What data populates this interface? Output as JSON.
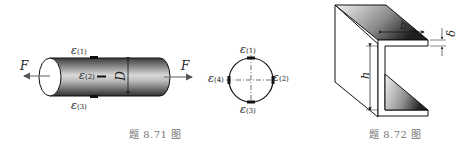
{
  "figure_871": {
    "caption": "题 8.71 图",
    "force_left": "F",
    "force_right": "F",
    "diameter_label": "D",
    "gauges_side_view": [
      {
        "symbol": "ε",
        "index": "(1)"
      },
      {
        "symbol": "ε",
        "index": "(2)"
      },
      {
        "symbol": "ε",
        "index": "(3)"
      }
    ],
    "gauges_cross_section": [
      {
        "symbol": "ε",
        "index": "(1)"
      },
      {
        "symbol": "ε",
        "index": "(2)"
      },
      {
        "symbol": "ε",
        "index": "(3)"
      },
      {
        "symbol": "ε",
        "index": "(4)"
      }
    ]
  },
  "figure_872": {
    "caption": "题 8.72 图",
    "width_label": "b",
    "height_label": "h",
    "thickness_label": "δ"
  }
}
